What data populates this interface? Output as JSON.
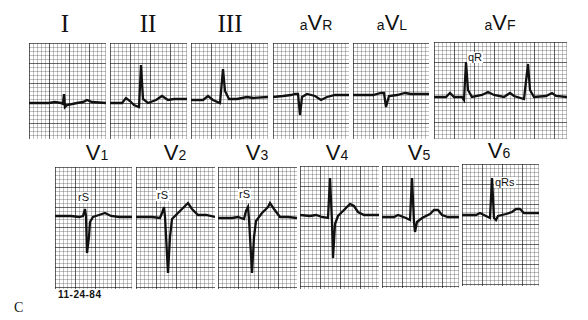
{
  "figure": {
    "panel_letter": "C",
    "date": "11-24-84",
    "grid_color": "#222222",
    "trace_color": "#111111",
    "background": "#ffffff"
  },
  "limb_leads": [
    {
      "id": "I",
      "label": "I",
      "style": "roman",
      "annotation": ""
    },
    {
      "id": "II",
      "label": "II",
      "style": "roman",
      "annotation": ""
    },
    {
      "id": "III",
      "label": "III",
      "style": "roman",
      "annotation": ""
    },
    {
      "id": "aVR",
      "prefix": "a",
      "main": "V",
      "sub": "R",
      "style": "aug",
      "annotation": ""
    },
    {
      "id": "aVL",
      "prefix": "a",
      "main": "V",
      "sub": "L",
      "style": "aug",
      "annotation": ""
    },
    {
      "id": "aVF",
      "prefix": "a",
      "main": "V",
      "sub": "F",
      "style": "aug",
      "annotation": "qR"
    }
  ],
  "precordial_leads": [
    {
      "id": "V1",
      "main": "V",
      "sub": "1",
      "annotation": "rS"
    },
    {
      "id": "V2",
      "main": "V",
      "sub": "2",
      "annotation": "rS"
    },
    {
      "id": "V3",
      "main": "V",
      "sub": "3",
      "annotation": "rS"
    },
    {
      "id": "V4",
      "main": "V",
      "sub": "4",
      "annotation": ""
    },
    {
      "id": "V5",
      "main": "V",
      "sub": "5",
      "annotation": ""
    },
    {
      "id": "V6",
      "main": "V",
      "sub": "6",
      "annotation": "qRs"
    }
  ]
}
